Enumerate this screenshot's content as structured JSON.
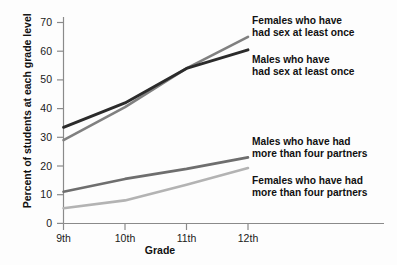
{
  "chart_data": {
    "type": "line",
    "title": "",
    "xlabel": "Grade",
    "ylabel": "Percent of students at each grade level",
    "categories": [
      "9th",
      "10th",
      "11th",
      "12th"
    ],
    "xtick_labels": [
      "9th",
      "10th",
      "11th",
      "12th"
    ],
    "ytick_labels": [
      "0",
      "10",
      "20",
      "30",
      "40",
      "50",
      "60",
      "70"
    ],
    "yticks": [
      0,
      10,
      20,
      30,
      40,
      50,
      60,
      70
    ],
    "ylim": [
      0,
      75
    ],
    "grid": false,
    "legend": "annotations-right",
    "series": [
      {
        "name": "Females who have had sex at least once",
        "label_line1": "Females who have",
        "label_line2": "had sex at least once",
        "color": "#808080",
        "values": [
          29.0,
          40.5,
          54.0,
          65.0
        ]
      },
      {
        "name": "Males who have had sex at least once",
        "label_line1": "Males who have",
        "label_line2": "had sex at least once",
        "color": "#2b2b2b",
        "values": [
          33.5,
          42.0,
          54.0,
          60.5
        ]
      },
      {
        "name": "Males who have had more than four partners",
        "label_line1": "Males who have had",
        "label_line2": "more than four partners",
        "color": "#6e6e6e",
        "values": [
          11.0,
          15.5,
          19.0,
          23.0
        ]
      },
      {
        "name": "Females who have had more than four partners",
        "label_line1": "Females who have had",
        "label_line2": "more than four partners",
        "color": "#b3b3b3",
        "values": [
          5.3,
          8.0,
          13.5,
          19.3
        ]
      }
    ]
  },
  "axes": {
    "x_title": "Grade",
    "y_title": "Percent of students at each grade level"
  },
  "annotations": {
    "females_sex_once": {
      "line1": "Females who have",
      "line2": "had sex at least once"
    },
    "males_sex_once": {
      "line1": "Males who have",
      "line2": "had sex at least once"
    },
    "males_four_partners": {
      "line1": "Males who have had",
      "line2": "more than four partners"
    },
    "females_four_partners": {
      "line1": "Females who have had",
      "line2": "more than four partners"
    }
  },
  "ticks": {
    "y": [
      "70",
      "60",
      "50",
      "40",
      "30",
      "20",
      "10",
      "0"
    ],
    "x": [
      "9th",
      "10th",
      "11th",
      "12th"
    ]
  },
  "colors": {
    "axis": "#8a8a8a",
    "text": "#111111",
    "series_dark": "#2b2b2b",
    "series_mid_gray": "#808080",
    "series_gray": "#6e6e6e",
    "series_light": "#b3b3b3",
    "background": "#fdfdfd"
  }
}
